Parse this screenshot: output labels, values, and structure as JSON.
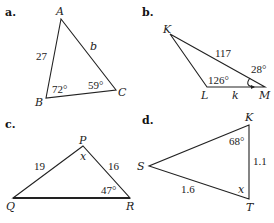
{
  "figures": [
    {
      "part": "a.",
      "vertices": {
        "A": "A",
        "B": "B",
        "C": "C"
      },
      "sides": {
        "AB": "27",
        "AC": "b"
      },
      "angles": {
        "B": "72°",
        "C": "59°"
      }
    },
    {
      "part": "b.",
      "vertices": {
        "K": "K",
        "L": "L",
        "M": "M"
      },
      "sides": {
        "KM": "117",
        "LM": "k"
      },
      "angles": {
        "L": "126°",
        "M": "28°"
      }
    },
    {
      "part": "c.",
      "vertices": {
        "P": "P",
        "Q": "Q",
        "R": "R"
      },
      "sides": {
        "PQ": "19",
        "PR": "16"
      },
      "angles": {
        "P": "x",
        "R": "47°"
      }
    },
    {
      "part": "d.",
      "vertices": {
        "K": "K",
        "S": "S",
        "T": "T"
      },
      "sides": {
        "KT": "1.1",
        "ST": "1.6"
      },
      "angles": {
        "K": "68°",
        "T": "x"
      }
    }
  ]
}
